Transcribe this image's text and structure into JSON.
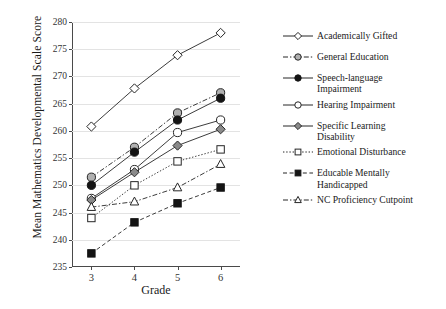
{
  "chart_data": {
    "type": "line",
    "title": "",
    "xlabel": "Grade",
    "ylabel": "Mean Mathematics Developmental Scale Score",
    "categories": [
      "3",
      "4",
      "5",
      "6"
    ],
    "x": [
      3,
      4,
      5,
      6
    ],
    "xlim": [
      2.55,
      6.45
    ],
    "ylim": [
      235,
      280
    ],
    "ytick_labels": [
      "280",
      "275",
      "270",
      "265",
      "260",
      "255",
      "250",
      "245",
      "240",
      "235"
    ],
    "yticks": [
      280,
      275,
      270,
      265,
      260,
      255,
      250,
      245,
      240,
      235
    ],
    "grid": "horizontal",
    "legend_position": "right",
    "series": [
      {
        "name": "Academically Gifted",
        "values": [
          260.8,
          267.8,
          273.9,
          278.0
        ],
        "marker": "diamond-open",
        "line": "solid",
        "fill": "#ffffff",
        "stroke": "#262626"
      },
      {
        "name": "General Education",
        "values": [
          251.5,
          257.0,
          263.3,
          267.0
        ],
        "marker": "circle-gray",
        "line": "dash-dot",
        "fill": "#b0b0b0",
        "stroke": "#262626"
      },
      {
        "name": "Speech-language\nImpairment",
        "values": [
          250.0,
          256.1,
          262.0,
          266.0
        ],
        "marker": "circle-filled",
        "line": "solid",
        "fill": "#141414",
        "stroke": "#141414"
      },
      {
        "name": "Hearing Impairment",
        "values": [
          247.6,
          252.9,
          259.7,
          262.0
        ],
        "marker": "circle-open",
        "line": "solid",
        "fill": "#ffffff",
        "stroke": "#262626"
      },
      {
        "name": "Specific Learning\nDisability",
        "values": [
          247.3,
          252.4,
          257.3,
          260.3
        ],
        "marker": "diamond-gray",
        "line": "solid",
        "fill": "#8a8a8a",
        "stroke": "#262626"
      },
      {
        "name": "Emotional Disturbance",
        "values": [
          244.0,
          250.0,
          254.4,
          256.6
        ],
        "marker": "square-open",
        "line": "dotted",
        "fill": "#ffffff",
        "stroke": "#262626"
      },
      {
        "name": "Educable Mentally\nHandicapped",
        "values": [
          237.5,
          243.2,
          246.7,
          249.6
        ],
        "marker": "square-filled",
        "line": "dashed",
        "fill": "#141414",
        "stroke": "#141414"
      },
      {
        "name": "NC Proficiency Cutpoint",
        "values": [
          246.0,
          247.0,
          249.6,
          253.9
        ],
        "marker": "triangle-open",
        "line": "dash-dot",
        "fill": "#ffffff",
        "stroke": "#262626"
      }
    ]
  },
  "axes": {
    "ylabel": "Mean Mathematics Developmental Scale Score",
    "xlabel": "Grade"
  },
  "legend": {
    "items": [
      {
        "label": "Academically Gifted"
      },
      {
        "label": "General Education"
      },
      {
        "label": "Speech-language\nImpairment"
      },
      {
        "label": "Hearing Impairment"
      },
      {
        "label": "Specific Learning\nDisability"
      },
      {
        "label": "Emotional Disturbance"
      },
      {
        "label": "Educable Mentally\nHandicapped"
      },
      {
        "label": "NC Proficiency Cutpoint"
      }
    ]
  }
}
